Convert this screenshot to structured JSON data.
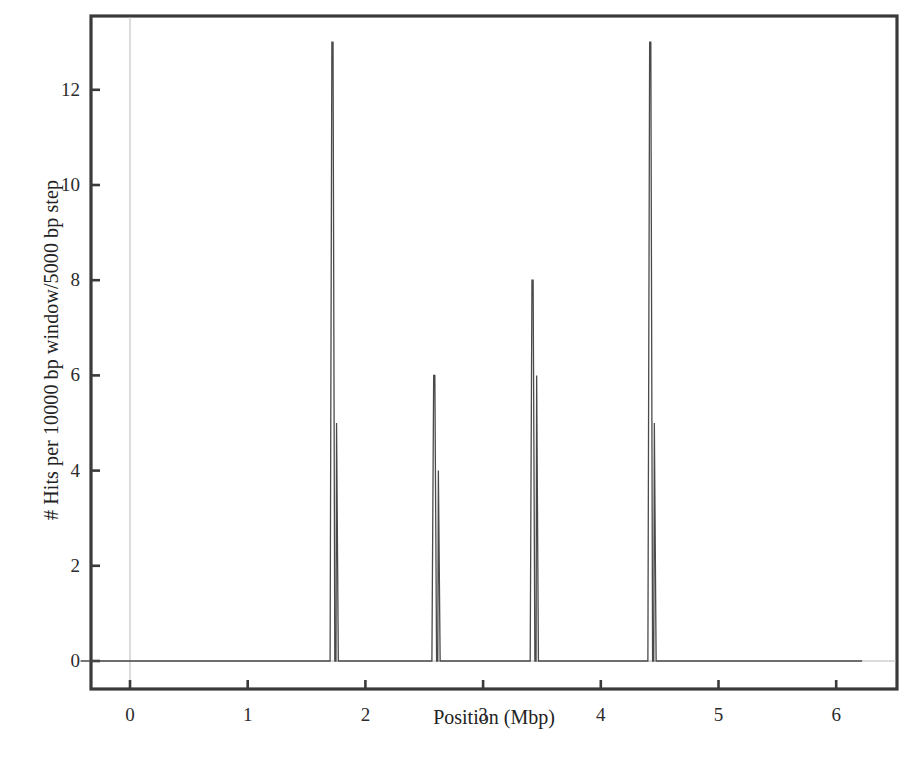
{
  "figure": {
    "background_color": "#ffffff",
    "frame_color": "#3a3a3a",
    "series_color": "#4a4a4a",
    "grid_color": "#b9b9b9"
  },
  "chart_data": {
    "type": "line",
    "title": "",
    "xlabel": "Position (Mbp)",
    "ylabel": "# Hits per 10000 bp window/5000 bp step",
    "xlim": [
      -0.42,
      6.52
    ],
    "ylim": [
      -0.55,
      13.7
    ],
    "xticks": [
      0,
      1,
      2,
      3,
      4,
      5,
      6
    ],
    "xtick_labels": [
      "0",
      "1",
      "2",
      "3",
      "4",
      "5",
      "6"
    ],
    "yticks": [
      0,
      2,
      4,
      6,
      8,
      10,
      12
    ],
    "ytick_labels": [
      "0",
      "2",
      "4",
      "6",
      "8",
      "10",
      "12"
    ],
    "grid": false,
    "legend": "none",
    "baseline_value": 0,
    "x_start": -0.42,
    "x_end": 6.22,
    "peaks": [
      {
        "label": "peak-1",
        "x": 1.725,
        "value": 13,
        "shoulder_x": 1.755,
        "shoulder_value": 5
      },
      {
        "label": "peak-2",
        "x": 2.59,
        "value": 6,
        "shoulder_x": 2.62,
        "shoulder_value": 4
      },
      {
        "label": "peak-3",
        "x": 3.425,
        "value": 8,
        "shoulder_x": 3.455,
        "shoulder_value": 6
      },
      {
        "label": "peak-4",
        "x": 4.425,
        "value": 13,
        "shoulder_x": 4.455,
        "shoulder_value": 5
      }
    ],
    "x": [
      -0.42,
      1.7,
      1.715,
      1.725,
      1.74,
      1.75,
      1.755,
      1.77,
      2.565,
      2.58,
      2.59,
      2.605,
      2.615,
      2.62,
      2.635,
      3.4,
      3.415,
      3.425,
      3.44,
      3.45,
      3.455,
      3.47,
      4.4,
      4.415,
      4.425,
      4.44,
      4.45,
      4.455,
      4.47,
      6.22
    ],
    "y": [
      0,
      0,
      13,
      13,
      0,
      0,
      5,
      0,
      0,
      6,
      6,
      0,
      0,
      4,
      0,
      0,
      8,
      8,
      0,
      0,
      6,
      0,
      0,
      13,
      13,
      0,
      0,
      5,
      0,
      0
    ]
  },
  "caption": {
    "partial_text": ""
  }
}
